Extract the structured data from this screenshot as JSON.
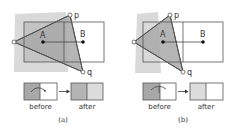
{
  "colors": {
    "background": "#ffffff",
    "shadow": "#d9d9d9",
    "triangle_fill": "#a8a8a8",
    "rect_overlap_fill": "#c6c6c6",
    "stroke": "#555555",
    "before_dark": "#a8a8a8",
    "after_light": "#dcdcdc",
    "after_dark": "#b4b4b4"
  },
  "panels": [
    {
      "id": "a",
      "caption": "(a)",
      "points": {
        "A": "A",
        "B": "B",
        "p": "p",
        "q": "q"
      },
      "before_label": "before",
      "after_label": "after"
    },
    {
      "id": "b",
      "caption": "(b)",
      "points": {
        "A": "A",
        "B": "B",
        "p": "p",
        "q": "q"
      },
      "before_label": "before",
      "after_label": "after"
    }
  ]
}
